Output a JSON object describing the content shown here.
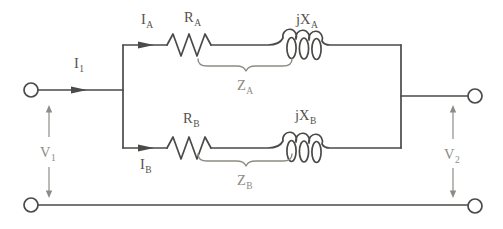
{
  "figure": {
    "kind": "circuit-diagram",
    "colors": {
      "wire": "#4a4a48",
      "brace": "#8e8b83",
      "voltage_arrow": "#8c8c86",
      "background": "#ffffff"
    },
    "labels": {
      "current_in": {
        "base": "I",
        "sub": "1"
      },
      "current_a": {
        "base": "I",
        "sub": "A"
      },
      "current_b": {
        "base": "I",
        "sub": "B"
      },
      "resistor_a": {
        "base": "R",
        "sub": "A"
      },
      "resistor_b": {
        "base": "R",
        "sub": "B"
      },
      "reactance_a": {
        "base": "jX",
        "sub": "A"
      },
      "reactance_b": {
        "base": "jX",
        "sub": "B"
      },
      "impedance_a": {
        "base": "Z",
        "sub": "A"
      },
      "impedance_b": {
        "base": "Z",
        "sub": "B"
      },
      "voltage_in": {
        "base": "V",
        "sub": "1"
      },
      "voltage_out": {
        "base": "V",
        "sub": "2"
      }
    }
  }
}
